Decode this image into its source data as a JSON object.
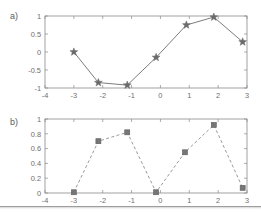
{
  "figure": {
    "background_color": "#ffffff",
    "axis_color": "#8a8a8a",
    "text_color": "#6e6e6e"
  },
  "panels": {
    "a": {
      "label": "a)"
    },
    "b": {
      "label": "b)"
    }
  },
  "chart_data": [
    {
      "type": "line",
      "panel_label": "a)",
      "title": "",
      "xlabel": "",
      "ylabel": "",
      "xlim": [
        -4,
        3
      ],
      "ylim": [
        -1,
        1
      ],
      "xticks": [
        -4,
        -3,
        -2,
        -1,
        0,
        1,
        2,
        3
      ],
      "xticklabels": [
        "-4",
        "-3",
        "-2",
        "-1",
        "0",
        "1",
        "2",
        "3"
      ],
      "yticks": [
        -1,
        -0.5,
        0,
        0.5,
        1
      ],
      "yticklabels": [
        "-1",
        "-0.5",
        "0",
        "0.5",
        "1"
      ],
      "grid": false,
      "legend": null,
      "line_style": "solid",
      "marker": "star",
      "marker_color": "#6a6a6a",
      "line_color": "#7d7d7d",
      "x": [
        -3.0,
        -2.15,
        -1.15,
        -0.15,
        0.9,
        1.85,
        2.85
      ],
      "values": [
        0.0,
        -0.85,
        -0.92,
        -0.15,
        0.75,
        0.97,
        0.28
      ]
    },
    {
      "type": "line",
      "panel_label": "b)",
      "title": "",
      "xlabel": "",
      "ylabel": "",
      "xlim": [
        -4,
        3
      ],
      "ylim": [
        0,
        1
      ],
      "xticks": [
        -4,
        -3,
        -2,
        -1,
        0,
        1,
        2,
        3
      ],
      "xticklabels": [
        "-4",
        "-3",
        "-2",
        "-1",
        "0",
        "1",
        "2",
        "3"
      ],
      "yticks": [
        0,
        0.2,
        0.4,
        0.6,
        0.8,
        1
      ],
      "yticklabels": [
        "0",
        "0.2",
        "0.4",
        "0.6",
        "0.8",
        "1"
      ],
      "grid": false,
      "legend": null,
      "line_style": "dashed",
      "marker": "square",
      "marker_color": "#767676",
      "line_color": "#9a9a9a",
      "x": [
        -3.0,
        -2.15,
        -1.15,
        -0.15,
        0.85,
        1.85,
        2.85
      ],
      "values": [
        0.01,
        0.7,
        0.82,
        0.01,
        0.55,
        0.92,
        0.07
      ]
    }
  ]
}
